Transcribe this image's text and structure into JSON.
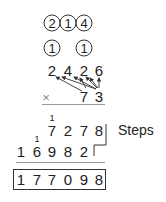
{
  "carries_circled": {
    "row1": [
      "2",
      "1",
      "4"
    ],
    "row2": [
      "1",
      "1"
    ]
  },
  "multiplicand": [
    "2",
    "4",
    "2",
    "6"
  ],
  "operator": "×",
  "multiplier": [
    "7",
    "3"
  ],
  "partial_product_1": {
    "carry": "1",
    "digits": [
      "7",
      "2",
      "7",
      "8"
    ]
  },
  "partial_product_2": {
    "carry": "1",
    "digits": [
      "1",
      "6",
      "9",
      "8",
      "2"
    ]
  },
  "result": [
    "1",
    "7",
    "7",
    "0",
    "9",
    "8"
  ],
  "steps_label": "Steps",
  "colors": {
    "ink": "#222222",
    "rule": "#999999"
  }
}
